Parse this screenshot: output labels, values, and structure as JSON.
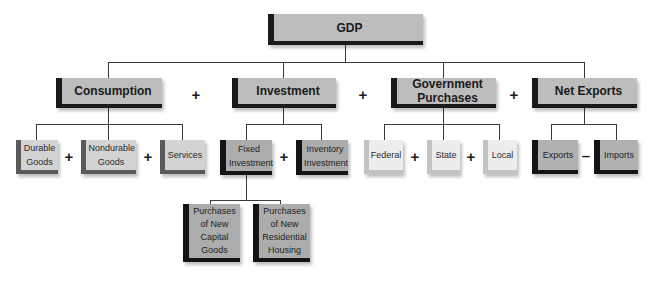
{
  "root": {
    "label": "GDP"
  },
  "components": [
    {
      "label": "Consumption",
      "children": [
        "Durable Goods",
        "Nondurable Goods",
        "Services"
      ],
      "operator": "+"
    },
    {
      "label": "Investment",
      "children": [
        "Fixed Investment",
        "Inventory Investment"
      ],
      "operator": "+"
    },
    {
      "label": "Government Purchases",
      "children": [
        "Federal",
        "State",
        "Local"
      ],
      "operator": "+"
    },
    {
      "label": "Net Exports",
      "children": [
        "Exports",
        "Imports"
      ],
      "operator": "−"
    }
  ],
  "fixed_investment_children": [
    "Purchases of New Capital Goods",
    "Purchases of New Residential Housing"
  ],
  "operators": {
    "plus": "+",
    "minus": "–"
  },
  "colors": {
    "main_fill": "#bdbdbd",
    "main_border": "#1a1a1a",
    "consumption_fill": "#d3d3d3",
    "consumption_border": "#5a5a5a",
    "investment_fill": "#acacac",
    "investment_border": "#141414",
    "government_fill": "#ededed",
    "government_border": "#c2c2c2",
    "net_exports_fill": "#b1b1b1",
    "net_exports_border": "#141414"
  }
}
